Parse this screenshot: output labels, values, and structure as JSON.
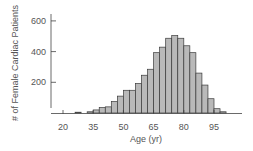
{
  "chart_data": {
    "type": "bar",
    "title": "",
    "xlabel": "Age (yr)",
    "ylabel": "# of Female Cardiac Patients",
    "xlim": [
      15,
      105
    ],
    "ylim": [
      0,
      640
    ],
    "x_ticks": [
      20,
      35,
      50,
      65,
      80,
      95
    ],
    "y_ticks": [
      200,
      400,
      600
    ],
    "bin_width": 3,
    "bin_starts": [
      26,
      29,
      32,
      35,
      38,
      41,
      44,
      47,
      50,
      53,
      56,
      59,
      62,
      65,
      68,
      71,
      74,
      77,
      80,
      83,
      86,
      89,
      92,
      95,
      98
    ],
    "values": [
      5,
      0,
      8,
      20,
      35,
      40,
      75,
      110,
      148,
      148,
      192,
      246,
      285,
      393,
      429,
      487,
      504,
      487,
      438,
      393,
      260,
      182,
      93,
      28,
      8
    ],
    "grid": false,
    "legend": null
  },
  "style": {
    "bar_fill": "#b9b9b9",
    "bar_stroke": "#3a3a3a",
    "axis_color": "#444444",
    "text_color": "#555555"
  }
}
